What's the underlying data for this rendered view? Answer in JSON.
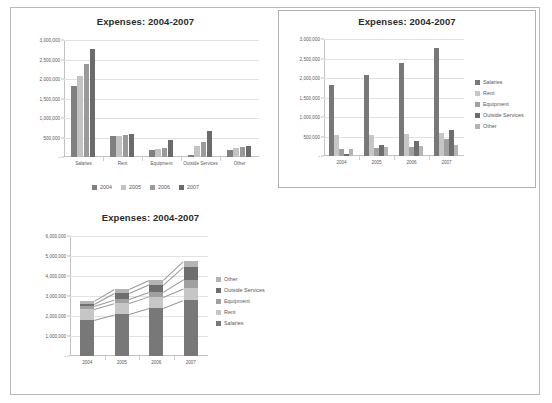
{
  "document": {
    "title": "Expenses: 2004-2007 charts sheet"
  },
  "charts": [
    {
      "id": "clustered-by-category",
      "title": "Expenses: 2004-2007",
      "bordered": false,
      "legend_position": "bottom",
      "ytick_labels": [
        "3,000,000",
        "2,500,000",
        "2,000,000",
        "1,500,000",
        "1,000,000",
        "500,000",
        "-"
      ],
      "chart_data": {
        "type": "bar",
        "title": "Expenses: 2004-2007",
        "xlabel": "",
        "ylabel": "",
        "ylim": [
          0,
          3000000
        ],
        "grid": true,
        "legend": "bottom",
        "categories": [
          "Salaries",
          "Rent",
          "Equipment",
          "Outside Services",
          "Other"
        ],
        "series": [
          {
            "name": "2004",
            "color": "#808080",
            "values": [
              1820000,
              530000,
              175000,
              60000,
              185000
            ]
          },
          {
            "name": "2005",
            "color": "#c3c3c3",
            "values": [
              2090000,
              545000,
              205000,
              290000,
              230000
            ]
          },
          {
            "name": "2006",
            "color": "#9a9a9a",
            "values": [
              2390000,
              575000,
              225000,
              375000,
              245000
            ]
          },
          {
            "name": "2007",
            "color": "#6b6b6b",
            "values": [
              2780000,
              600000,
              430000,
              660000,
              275000
            ]
          }
        ]
      }
    },
    {
      "id": "clustered-by-year",
      "title": "Expenses: 2004-2007",
      "bordered": true,
      "legend_position": "right",
      "ytick_labels": [
        "3,000,000",
        "2,500,000",
        "2,000,000",
        "1,500,000",
        "1,000,000",
        "500,000",
        "-"
      ],
      "chart_data": {
        "type": "bar",
        "title": "Expenses: 2004-2007",
        "xlabel": "",
        "ylabel": "",
        "ylim": [
          0,
          3000000
        ],
        "grid": true,
        "legend": "right",
        "categories": [
          "2004",
          "2005",
          "2006",
          "2007"
        ],
        "series": [
          {
            "name": "Salaries",
            "color": "#787878",
            "values": [
              1820000,
              2090000,
              2390000,
              2780000
            ]
          },
          {
            "name": "Rent",
            "color": "#c6c6c6",
            "values": [
              530000,
              545000,
              575000,
              600000
            ]
          },
          {
            "name": "Equipment",
            "color": "#a0a0a0",
            "values": [
              175000,
              205000,
              225000,
              430000
            ]
          },
          {
            "name": "Outside Services",
            "color": "#6e6e6e",
            "values": [
              60000,
              290000,
              375000,
              660000
            ]
          },
          {
            "name": "Other",
            "color": "#b4b4b4",
            "values": [
              185000,
              230000,
              245000,
              275000
            ]
          }
        ]
      }
    },
    {
      "id": "stacked-by-year",
      "title": "Expenses: 2004-2007",
      "bordered": false,
      "legend_position": "right",
      "ytick_labels": [
        "6,000,000",
        "5,000,000",
        "4,000,000",
        "3,000,000",
        "2,000,000",
        "1,000,000",
        "-"
      ],
      "legend_order": [
        "Other",
        "Outside Services",
        "Equipment",
        "Rent",
        "Salaries"
      ],
      "chart_data": {
        "type": "bar",
        "subtype": "stacked",
        "title": "Expenses: 2004-2007",
        "xlabel": "",
        "ylabel": "",
        "ylim": [
          0,
          6000000
        ],
        "grid": true,
        "legend": "right",
        "categories": [
          "2004",
          "2005",
          "2006",
          "2007"
        ],
        "series": [
          {
            "name": "Salaries",
            "color": "#787878",
            "values": [
              1820000,
              2090000,
              2390000,
              2780000
            ]
          },
          {
            "name": "Rent",
            "color": "#c6c6c6",
            "values": [
              530000,
              545000,
              575000,
              600000
            ]
          },
          {
            "name": "Equipment",
            "color": "#a0a0a0",
            "values": [
              175000,
              205000,
              225000,
              430000
            ]
          },
          {
            "name": "Outside Services",
            "color": "#6e6e6e",
            "values": [
              60000,
              290000,
              375000,
              660000
            ]
          },
          {
            "name": "Other",
            "color": "#b4b4b4",
            "values": [
              185000,
              230000,
              245000,
              275000
            ]
          }
        ],
        "totals": [
          2770000,
          3360000,
          3810000,
          4745000
        ]
      }
    }
  ]
}
